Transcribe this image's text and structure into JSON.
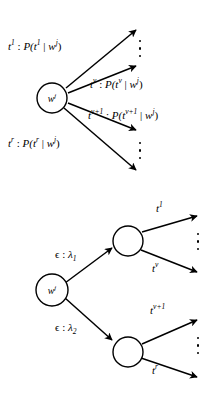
{
  "figure": {
    "background_color": "#ffffff",
    "stroke_color": "#000000"
  },
  "diagrams": [
    {
      "id": "flat-emission-tree",
      "name": "flat-emission-tree",
      "root_node": {
        "label": "w",
        "superscript": "j"
      },
      "branches": [
        {
          "id": "branch-t1",
          "label_tag": "t",
          "label_tag_sup": "1",
          "label_full": "t^1 : P(t^1 | w^j)",
          "label_parts": {
            "tag": "t",
            "tag_sup": "1",
            "sep": " : ",
            "prob": "P(",
            "prob_tag": "t",
            "prob_tag_sup": "1",
            "bar": " | ",
            "word": "w",
            "word_sup": "j",
            "close": ")"
          }
        },
        {
          "id": "branch-tv",
          "label_tag": "t",
          "label_tag_sup": "v",
          "label_full": "t^v : P(t^v | w^j)",
          "label_parts": {
            "tag": "t",
            "tag_sup": "v",
            "sep": " : ",
            "prob": "P(",
            "prob_tag": "t",
            "prob_tag_sup": "v",
            "bar": " | ",
            "word": "w",
            "word_sup": "j",
            "close": ")"
          }
        },
        {
          "id": "branch-tv1",
          "label_tag": "t",
          "label_tag_sup": "v+1",
          "label_full": "t^{v+1} : P(t^{v+1} | w^j)",
          "label_parts": {
            "tag": "t",
            "tag_sup": "v+1",
            "sep": " : ",
            "prob": "P(",
            "prob_tag": "t",
            "prob_tag_sup": "v+1",
            "bar": " | ",
            "word": "w",
            "word_sup": "j",
            "close": ")"
          }
        },
        {
          "id": "branch-tr",
          "label_tag": "t",
          "label_tag_sup": "r",
          "label_full": "t^r : P(t^r | w^j)",
          "label_parts": {
            "tag": "t",
            "tag_sup": "r",
            "sep": " : ",
            "prob": "P(",
            "prob_tag": "t",
            "prob_tag_sup": "r",
            "bar": " | ",
            "word": "w",
            "word_sup": "j",
            "close": ")"
          }
        }
      ],
      "ellipses": [
        {
          "id": "ellipsis-upper",
          "dots": 3
        },
        {
          "id": "ellipsis-lower",
          "dots": 3
        }
      ]
    },
    {
      "id": "hierarchical-emission-tree",
      "name": "hierarchical-emission-tree",
      "root_node": {
        "label": "w",
        "superscript": "j"
      },
      "intermediate_nodes": [
        {
          "id": "node-upper",
          "label": ""
        },
        {
          "id": "node-lower",
          "label": ""
        }
      ],
      "edge_labels": [
        {
          "id": "edge-lambda1",
          "epsilon": "ϵ",
          "sep": " : ",
          "lambda": "λ",
          "lambda_sub": "1",
          "text": "ϵ : λ1"
        },
        {
          "id": "edge-lambda2",
          "epsilon": "ϵ",
          "sep": " : ",
          "lambda": "λ",
          "lambda_sub": "2",
          "text": "ϵ : λ2"
        }
      ],
      "leaf_labels": [
        {
          "id": "leaf-t1",
          "tag": "t",
          "sup": "1"
        },
        {
          "id": "leaf-tv",
          "tag": "t",
          "sup": "v"
        },
        {
          "id": "leaf-tv1",
          "tag": "t",
          "sup": "v+1"
        },
        {
          "id": "leaf-tr",
          "tag": "t",
          "sup": "r"
        }
      ],
      "ellipses": [
        {
          "id": "ellipsis-upper",
          "dots": 3
        },
        {
          "id": "ellipsis-lower",
          "dots": 3
        }
      ]
    }
  ]
}
